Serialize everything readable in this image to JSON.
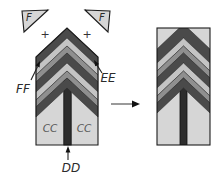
{
  "diagram": {
    "labels": {
      "f_left": "F",
      "f_right": "F",
      "plus_left": "+",
      "plus_right": "+",
      "ff": "FF",
      "ee": "EE",
      "cc_left": "CC",
      "cc_right": "CC",
      "dd": "DD"
    },
    "colors": {
      "background": "#ffffff",
      "panel_fill": "#d6d6d6",
      "band_dark": "#4a4a4a",
      "band_light": "#c4c4c4",
      "band_medium": "#8f8f8f",
      "dike_fill": "#2d2d2d",
      "outline": "#1c1c1c",
      "arrow_shaft_gray": "#9a9a9a",
      "arrow_head_black": "#111111",
      "label_color": "#2b2b2b"
    }
  }
}
